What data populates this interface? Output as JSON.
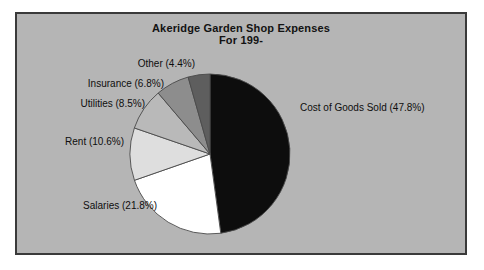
{
  "figure": {
    "title_line1": "Akeridge Garden Shop Expenses",
    "title_line2": "For 199-",
    "panel_bg_color": "#b5b5b5",
    "panel_border_color": "#3a3a3a",
    "page_bg_color": "#ffffff"
  },
  "chart_data": {
    "type": "pie",
    "title": "Akeridge Garden Shop Expenses For 199-",
    "subtitle": "For 199-",
    "xlabel": "",
    "ylabel": "",
    "legend_position": "none",
    "grid": false,
    "start_angle_deg": 90,
    "direction": "clockwise",
    "categories": [
      "Cost of Goods Sold",
      "Salaries",
      "Rent",
      "Utilities",
      "Insurance",
      "Other"
    ],
    "values": [
      47.8,
      21.8,
      10.6,
      8.5,
      6.8,
      4.4
    ],
    "units": "percent",
    "slices": [
      {
        "label": "Cost of Goods Sold (47.8%)",
        "name": "Cost of Goods Sold",
        "value": 47.8,
        "color": "#0d0d0d"
      },
      {
        "label": "Salaries (21.8%)",
        "name": "Salaries",
        "value": 21.8,
        "color": "#ffffff"
      },
      {
        "label": "Rent (10.6%)",
        "name": "Rent",
        "value": 10.6,
        "color": "#dedede"
      },
      {
        "label": "Utilities (8.5%)",
        "name": "Utilities",
        "value": 8.5,
        "color": "#b9b9b9"
      },
      {
        "label": "Insurance (6.8%)",
        "name": "Insurance",
        "value": 6.8,
        "color": "#8d8d8d"
      },
      {
        "label": "Other (4.4%)",
        "name": "Other",
        "value": 4.4,
        "color": "#5e5e5e"
      }
    ]
  },
  "labels": {
    "cost_of_goods_sold": "Cost of Goods Sold (47.8%)",
    "salaries": "Salaries (21.8%)",
    "rent": "Rent (10.6%)",
    "utilities": "Utilities (8.5%)",
    "insurance": "Insurance (6.8%)",
    "other": "Other (4.4%)"
  }
}
